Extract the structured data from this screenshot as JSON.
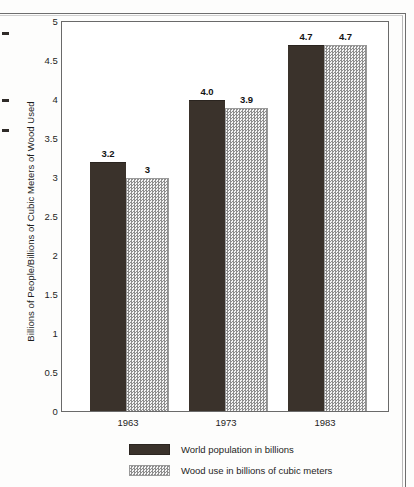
{
  "chart_data": {
    "type": "bar",
    "title": "",
    "subtitle": "",
    "xlabel": "",
    "ylabel": "Billions of People/Billions of Cubic Meters of Wood Used",
    "categories": [
      "1963",
      "1973",
      "1983"
    ],
    "ylim": [
      0,
      5
    ],
    "yticks": [
      "0",
      "0.5",
      "1",
      "1.5",
      "2",
      "2.5",
      "3",
      "3.5",
      "4",
      "4.5",
      "5"
    ],
    "ytick_values": [
      0,
      0.5,
      1,
      1.5,
      2,
      2.5,
      3,
      3.5,
      4,
      4.5,
      5
    ],
    "grid": false,
    "legend_position": "bottom",
    "series": [
      {
        "name": "World population in billions",
        "color": "#3a322b",
        "pattern": "solid",
        "values": [
          3.2,
          4.0,
          4.7
        ],
        "labels": [
          "3.2",
          "4.0",
          "4.7"
        ]
      },
      {
        "name": "Wood use in billions of cubic meters",
        "color": "#f2f2f2",
        "pattern": "dotted",
        "values": [
          3.0,
          3.9,
          4.7
        ],
        "labels": [
          "3",
          "3.9",
          "4.7"
        ]
      }
    ]
  },
  "legend": {
    "items": [
      {
        "label": "World population in billions"
      },
      {
        "label": "Wood use in billions of cubic meters"
      }
    ]
  }
}
